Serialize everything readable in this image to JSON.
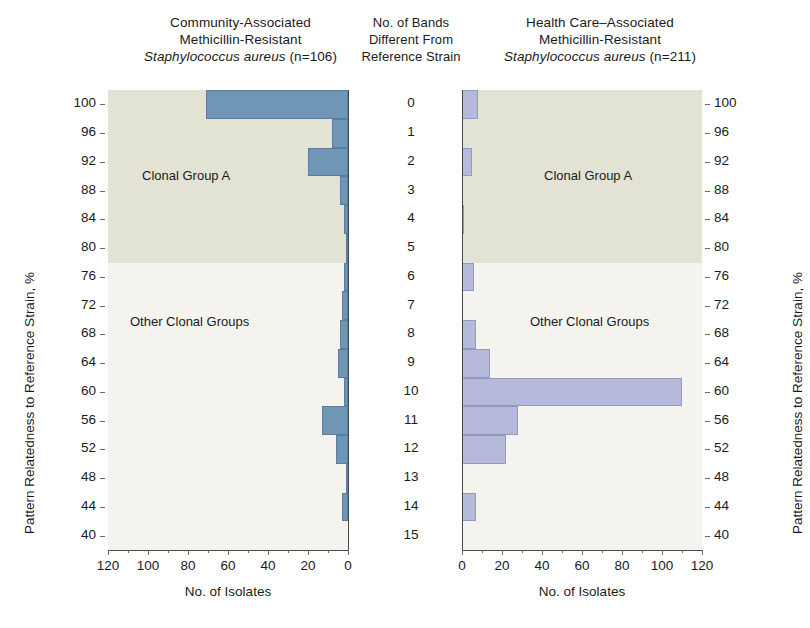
{
  "figure": {
    "left_panel_title_lines": [
      "Community-Associated",
      "Methicillin-Resistant"
    ],
    "left_panel_title_italic": "Staphylococcus aureus",
    "left_panel_title_n": " (n=106)",
    "middle_column_title_lines": [
      "No. of Bands",
      "Different From",
      "Reference Strain"
    ],
    "right_panel_title_lines": [
      "Health Care–Associated",
      "Methicillin-Resistant"
    ],
    "right_panel_title_italic": "Staphylococcus aureus",
    "right_panel_title_n": " (n=211)",
    "zone_label_a": "Clonal Group A",
    "zone_label_other": "Other Clonal Groups",
    "x_axis_title": "No. of Isolates",
    "y_axis_title": "Pattern Relatedness to Reference Strain, %"
  },
  "colors": {
    "bar_left": "#6f96b5",
    "bar_left_edge": "#5a7f9c",
    "bar_right": "#b5bada",
    "bar_right_edge": "#9299c2",
    "plot_background": "#f4f3ee",
    "clonal_group_a_band": "#e2e3d5",
    "axis": "#4a4a4a",
    "text": "#1b1b1b"
  },
  "chart_data": {
    "type": "bar",
    "orientation": "horizontal",
    "xlabel": "No. of Isolates",
    "ylabel": "Pattern Relatedness to Reference Strain, %",
    "grid": false,
    "legend": "none",
    "categories": [
      "0",
      "1",
      "2",
      "3",
      "4",
      "5",
      "6",
      "7",
      "8",
      "9",
      "10",
      "11",
      "12",
      "13",
      "14",
      "15"
    ],
    "category_axis_label": "No. of Bands Different From Reference Strain",
    "y_tick_labels": [
      "100",
      "96",
      "92",
      "88",
      "84",
      "80",
      "76",
      "72",
      "68",
      "64",
      "60",
      "56",
      "52",
      "48",
      "44",
      "40"
    ],
    "y_tick_values": [
      100,
      96,
      92,
      88,
      84,
      80,
      76,
      72,
      68,
      64,
      60,
      56,
      52,
      48,
      44,
      40
    ],
    "percent_for_band": [
      100,
      97,
      93,
      89,
      85,
      81,
      77,
      73,
      69,
      65,
      61,
      57,
      53,
      49,
      45,
      41
    ],
    "clonal_group_a_band_percent_range": [
      74,
      102
    ],
    "panels": [
      {
        "name": "Community-Associated Methicillin-Resistant Staphylococcus aureus",
        "n": 106,
        "bar_color": "#6f96b5",
        "x_axis_reversed": true,
        "xlim": [
          0,
          120
        ],
        "x_tick_labels": [
          "120",
          "100",
          "80",
          "60",
          "40",
          "20",
          "0"
        ],
        "x_tick_values": [
          120,
          100,
          80,
          60,
          40,
          20,
          0
        ],
        "values": [
          71,
          8,
          20,
          4,
          2,
          1,
          2,
          3,
          4,
          5,
          2,
          13,
          6,
          1,
          3,
          0
        ]
      },
      {
        "name": "Health Care–Associated Methicillin-Resistant Staphylococcus aureus",
        "n": 211,
        "bar_color": "#b5bada",
        "x_axis_reversed": false,
        "xlim": [
          0,
          120
        ],
        "x_tick_labels": [
          "0",
          "20",
          "40",
          "60",
          "80",
          "100",
          "120"
        ],
        "x_tick_values": [
          0,
          20,
          40,
          60,
          80,
          100,
          120
        ],
        "values": [
          8,
          0,
          5,
          0,
          1,
          0,
          6,
          0,
          7,
          14,
          110,
          28,
          22,
          0,
          7,
          0
        ]
      }
    ]
  }
}
